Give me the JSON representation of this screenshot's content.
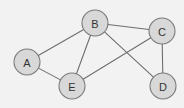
{
  "diagram": {
    "width": 184,
    "height": 108,
    "background_color": "#f2f2f2",
    "node_fill_color": "#d8d8d8",
    "node_stroke_color": "#7a7a7a",
    "edge_color": "#6e6e6e",
    "label_color": "#333333",
    "node_radius": 13,
    "nodes": [
      {
        "id": "A",
        "label": "A",
        "x": 27,
        "y": 62
      },
      {
        "id": "B",
        "label": "B",
        "x": 95,
        "y": 23
      },
      {
        "id": "C",
        "label": "C",
        "x": 162,
        "y": 31
      },
      {
        "id": "D",
        "label": "D",
        "x": 163,
        "y": 86
      },
      {
        "id": "E",
        "label": "E",
        "x": 72,
        "y": 86
      }
    ],
    "edges": [
      {
        "from": "A",
        "to": "B"
      },
      {
        "from": "A",
        "to": "E"
      },
      {
        "from": "B",
        "to": "E"
      },
      {
        "from": "B",
        "to": "C"
      },
      {
        "from": "B",
        "to": "D"
      },
      {
        "from": "C",
        "to": "E"
      },
      {
        "from": "C",
        "to": "D"
      }
    ]
  }
}
